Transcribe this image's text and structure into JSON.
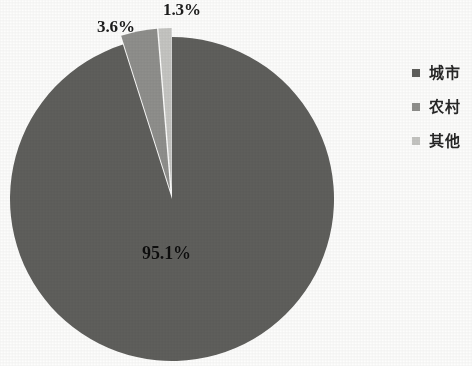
{
  "chart_data": {
    "type": "pie",
    "title": "",
    "subtitle": "",
    "xlabel": "",
    "ylabel": "",
    "grid": false,
    "legend_position": "right",
    "exploded": true,
    "start_angle_deg": -90,
    "categories": [
      "城市",
      "农村",
      "其他"
    ],
    "values": [
      95.1,
      3.6,
      1.3
    ],
    "value_unit": "%",
    "slices": [
      {
        "name": "城市",
        "value": 95.1,
        "label": "95.1%",
        "color": "#5f5f5c",
        "label_position": "inside"
      },
      {
        "name": "农村",
        "value": 3.6,
        "label": "3.6%",
        "color": "#8f8f8c",
        "label_position": "outside"
      },
      {
        "name": "其他",
        "value": 1.3,
        "label": "1.3%",
        "color": "#c5c5c2",
        "label_position": "outside"
      }
    ],
    "annotations": [
      "95.1%",
      "3.6%",
      "1.3%"
    ]
  },
  "legend": {
    "items": [
      {
        "label": "城市",
        "color": "#5f5f5c"
      },
      {
        "label": "农村",
        "color": "#8f8f8c"
      },
      {
        "label": "其他",
        "color": "#c5c5c2"
      }
    ]
  },
  "labels": {
    "city": "95.1%",
    "rural": "3.6%",
    "other": "1.3%"
  },
  "colors": {
    "background": "#fdfdfc",
    "slice_city": "#5f5f5c",
    "slice_rural": "#8f8f8c",
    "slice_other": "#c5c5c2",
    "text": "#1c1c1c"
  }
}
